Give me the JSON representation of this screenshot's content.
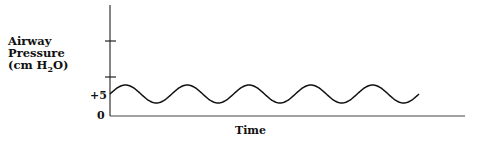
{
  "chart_data": {
    "type": "line",
    "title": "",
    "xlabel": "Time",
    "ylabel": "Airway Pressure (cm H2O)",
    "ylabel_lines": [
      "Airway",
      "Pressure",
      "(cm H",
      "2",
      "O)"
    ],
    "y_tick_labels": [
      "0",
      "+5"
    ],
    "y_ticks_unlabeled": 2,
    "grid": false,
    "legend": null,
    "series": [
      {
        "name": "Airway pressure waveform (CPAP oscillation around +5)",
        "shape": "sinusoid",
        "baseline": 5,
        "cycles": 5,
        "x": [
          0,
          0.5,
          1,
          1.5,
          2,
          2.5,
          3,
          3.5,
          4,
          4.5,
          5
        ],
        "values": [
          6,
          5,
          4,
          5,
          6,
          5,
          4,
          5,
          6,
          5,
          4
        ]
      }
    ]
  },
  "labels": {
    "y_line1": "Airway",
    "y_line2": "Pressure",
    "y_line3_pre": "(cm H",
    "y_line3_sub": "2",
    "y_line3_post": "O)",
    "tick_plus5": "+5",
    "tick_zero": "0",
    "x_axis": "Time"
  }
}
